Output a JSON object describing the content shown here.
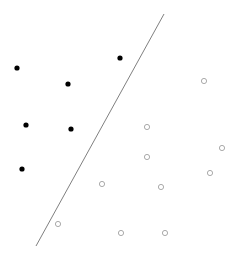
{
  "diagram": {
    "type": "linear-separator-scatter",
    "background": "#ffffff",
    "separator": {
      "x1": 164,
      "y1": 14,
      "x2": 36,
      "y2": 246,
      "color": "#808080",
      "width": 1
    },
    "class_filled": {
      "color": "#000000",
      "radius": 2.6,
      "points": [
        {
          "x": 17,
          "y": 68
        },
        {
          "x": 68,
          "y": 84
        },
        {
          "x": 120,
          "y": 58
        },
        {
          "x": 26,
          "y": 125
        },
        {
          "x": 71,
          "y": 129
        },
        {
          "x": 22,
          "y": 169
        }
      ]
    },
    "class_hollow": {
      "stroke": "#a0a0a0",
      "radius": 2.6,
      "points": [
        {
          "x": 204,
          "y": 81
        },
        {
          "x": 147,
          "y": 127
        },
        {
          "x": 147,
          "y": 157
        },
        {
          "x": 222,
          "y": 148
        },
        {
          "x": 210,
          "y": 173
        },
        {
          "x": 161,
          "y": 187
        },
        {
          "x": 102,
          "y": 184
        },
        {
          "x": 58,
          "y": 224
        },
        {
          "x": 121,
          "y": 233
        },
        {
          "x": 165,
          "y": 233
        }
      ]
    }
  }
}
